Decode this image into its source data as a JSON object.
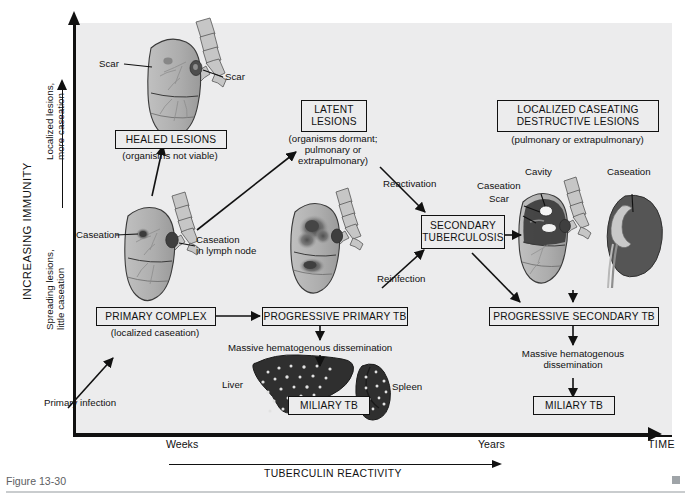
{
  "figure": {
    "caption": "Figure 13-30"
  },
  "axes": {
    "y_title": "INCREASING IMMUNITY",
    "y_upper_label_line1": "Localized lesions,",
    "y_upper_label_line2": "more caseation",
    "y_lower_label_line1": "Spreading lesions,",
    "y_lower_label_line2": "little caseation",
    "x_title": "TIME",
    "x_tick_left": "Weeks",
    "x_tick_right": "Years",
    "x_subaxis_title": "TUBERCULIN REACTIVITY"
  },
  "boxes": {
    "healed": {
      "title": "HEALED LESIONS",
      "subtitle": "(organisms not viable)"
    },
    "latent": {
      "title_line1": "LATENT",
      "title_line2": "LESIONS",
      "subtitle_line1": "(organisms dormant;",
      "subtitle_line2": "pulmonary or extrapulmonary)"
    },
    "localized_caseating": {
      "title_line1": "LOCALIZED CASEATING",
      "title_line2": "DESTRUCTIVE LESIONS",
      "subtitle": "(pulmonary or extrapulmonary)"
    },
    "secondary_tb": {
      "title_line1": "SECONDARY",
      "title_line2": "TUBERCULOSIS"
    },
    "primary_complex": {
      "title": "PRIMARY COMPLEX",
      "subtitle": "(localized caseation)"
    },
    "progressive_primary": {
      "title": "PROGRESSIVE PRIMARY TB"
    },
    "progressive_secondary": {
      "title": "PROGRESSIVE SECONDARY TB"
    },
    "miliary_left": {
      "title": "MILIARY TB"
    },
    "miliary_right": {
      "title": "MILIARY TB"
    }
  },
  "annotations": {
    "scar_left": "Scar",
    "scar_right": "Scar",
    "caseation_left": "Caseation",
    "caseation_lymph_line1": "Caseation",
    "caseation_lymph_line2": "in lymph node",
    "primary_infection": "Primary infection",
    "reactivation": "Reactivation",
    "reinfection": "Reinfection",
    "cavity": "Cavity",
    "caseation_cavity": "Caseation",
    "scar_cavity": "Scar",
    "caseation_kidney": "Caseation",
    "liver": "Liver",
    "spleen": "Spleen",
    "dissemination_left": "Massive hematogenous dissemination",
    "dissemination_right_line1": "Massive hematogenous",
    "dissemination_right_line2": "dissemination"
  },
  "colors": {
    "panel_background": "#ececed",
    "page_background": "#ffffff",
    "ink": "#111111",
    "caption_gray": "#5d6063",
    "organ_light": "#b4b4b4",
    "organ_mid": "#8e8e8e",
    "organ_dark": "#4a4a4a",
    "organ_darkest": "#343434"
  }
}
